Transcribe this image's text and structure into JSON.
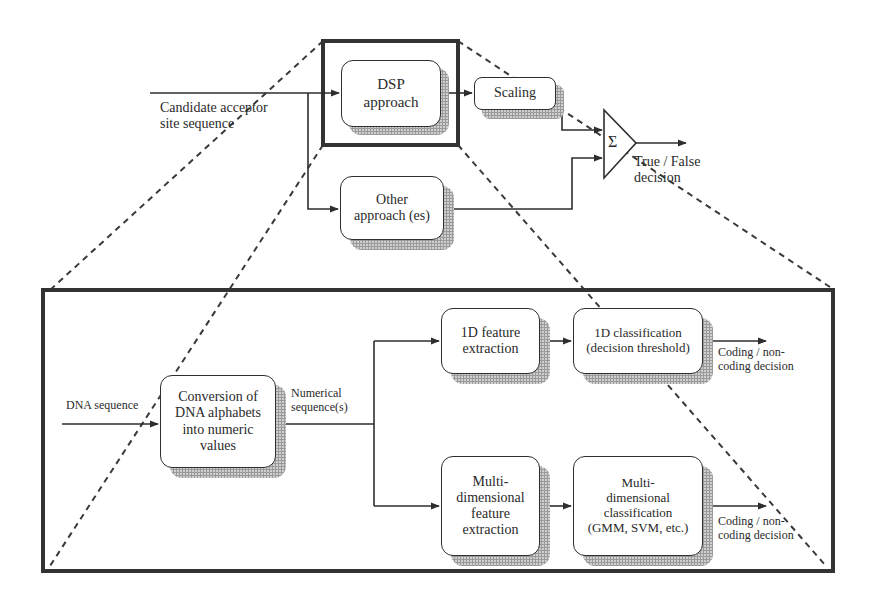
{
  "diagram": {
    "top_system": {
      "input_label": "Candidate acceptor\nsite sequence",
      "dsp_box": "DSP\napproach",
      "scaling_box": "Scaling",
      "other_box": "Other\napproach (es)",
      "sum_symbol": "Σ",
      "output_label": "True / False\ndecision"
    },
    "detail_panel": {
      "input_label": "DNA sequence",
      "conversion_box": "Conversion of\nDNA alphabets\ninto numeric\nvalues",
      "numerical_label": "Numerical\nsequence(s)",
      "feature_1d_box": "1D feature\nextraction",
      "classification_1d_box": "1D classification\n(decision threshold)",
      "output_1d_label": "Coding / non-\ncoding decision",
      "feature_md_box": "Multi-\ndimensional\nfeature\nextraction",
      "classification_md_box": "Multi-\ndimensional\nclassification\n(GMM, SVM, etc.)",
      "output_md_label": "Coding / non-\ncoding decision"
    },
    "colors": {
      "line": "#2e2e2e",
      "frame": "#333333",
      "shadow": "#cfcfcf",
      "dashed": "#3a3a3a"
    }
  }
}
